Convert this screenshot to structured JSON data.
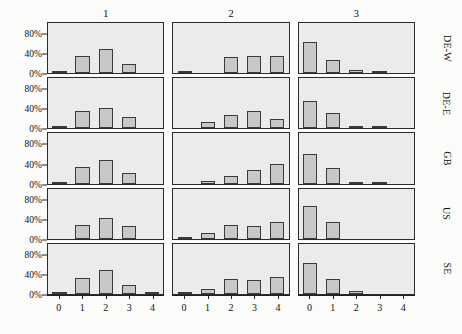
{
  "chart_data": {
    "type": "bar",
    "title": "",
    "subtitle": "",
    "xlabel": "",
    "ylabel": "",
    "grid": false,
    "legend_position": "none",
    "layout": "trellis 5 rows x 3 columns",
    "x": [
      0,
      1,
      2,
      3,
      4
    ],
    "xtick_labels": [
      "0",
      "1",
      "2",
      "3",
      "4"
    ],
    "ytick_labels": [
      "0%",
      "40%",
      "80%"
    ],
    "ytick_values": [
      0,
      40,
      80
    ],
    "ylim": [
      0,
      100
    ],
    "y_unit": "percent",
    "column_labels": [
      "1",
      "2",
      "3"
    ],
    "row_labels": [
      "DE-W",
      "DE-E",
      "GB",
      "US",
      "SE"
    ],
    "panels": [
      {
        "row": "DE-W",
        "column": "1",
        "values": [
          2,
          35,
          48,
          18,
          0
        ]
      },
      {
        "row": "DE-W",
        "column": "2",
        "values": [
          2,
          0,
          33,
          35,
          35
        ]
      },
      {
        "row": "DE-W",
        "column": "3",
        "values": [
          63,
          26,
          6,
          2,
          0
        ]
      },
      {
        "row": "DE-E",
        "column": "1",
        "values": [
          4,
          35,
          40,
          22,
          0
        ]
      },
      {
        "row": "DE-E",
        "column": "2",
        "values": [
          0,
          12,
          26,
          35,
          18
        ]
      },
      {
        "row": "DE-E",
        "column": "3",
        "values": [
          55,
          30,
          4,
          2,
          0
        ]
      },
      {
        "row": "GB",
        "column": "1",
        "values": [
          2,
          33,
          47,
          22,
          0
        ]
      },
      {
        "row": "GB",
        "column": "2",
        "values": [
          0,
          6,
          16,
          28,
          40
        ]
      },
      {
        "row": "GB",
        "column": "3",
        "values": [
          58,
          32,
          3,
          3,
          0
        ]
      },
      {
        "row": "US",
        "column": "1",
        "values": [
          0,
          28,
          42,
          26,
          0
        ]
      },
      {
        "row": "US",
        "column": "2",
        "values": [
          3,
          11,
          27,
          25,
          33
        ]
      },
      {
        "row": "US",
        "column": "3",
        "values": [
          66,
          33,
          0,
          0,
          0
        ]
      },
      {
        "row": "SE",
        "column": "1",
        "values": [
          3,
          32,
          48,
          18,
          2
        ]
      },
      {
        "row": "SE",
        "column": "2",
        "values": [
          4,
          10,
          30,
          27,
          33
        ]
      },
      {
        "row": "SE",
        "column": "3",
        "values": [
          62,
          30,
          7,
          0,
          0
        ]
      }
    ],
    "colors": {
      "bar_fill": "#c8c8c8",
      "bar_border": "#3a3a3a",
      "panel_background": "#ebebeb",
      "panel_border": "#2b2b2b",
      "page_background": "#fbfbfa",
      "text": "#111111"
    }
  }
}
